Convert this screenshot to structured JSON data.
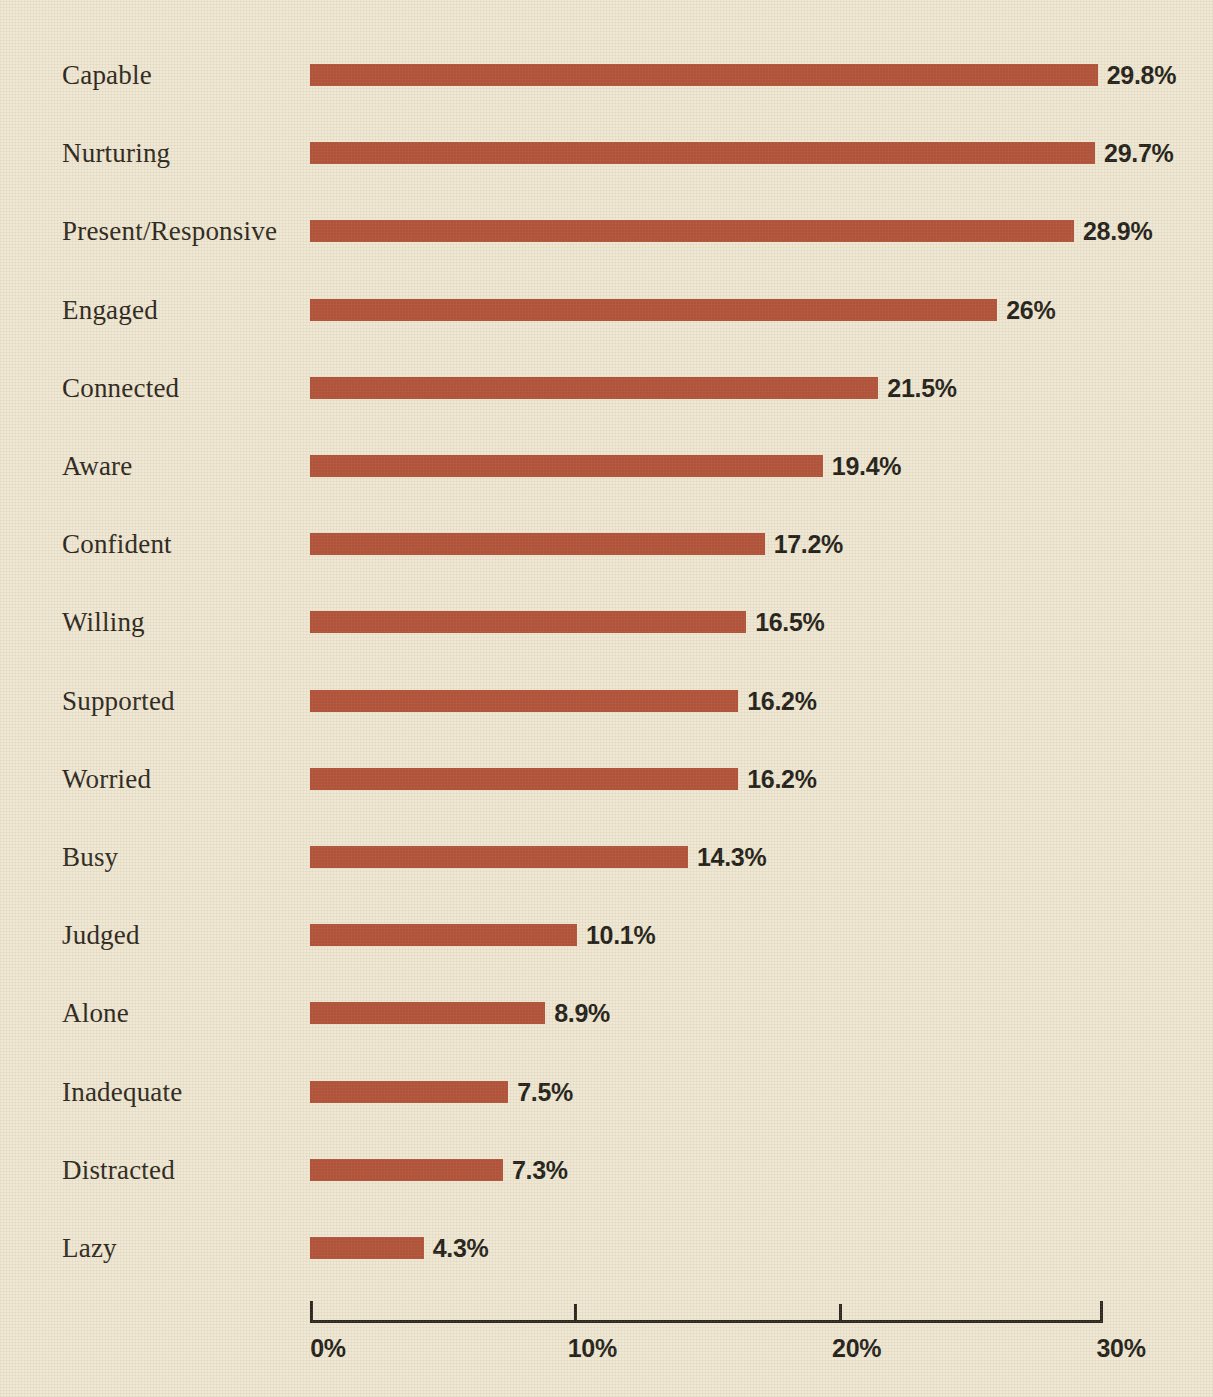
{
  "chart_data": {
    "type": "bar",
    "orientation": "horizontal",
    "title": "",
    "subtitle": "",
    "xlabel": "",
    "ylabel": "",
    "xlim": [
      0,
      30
    ],
    "grid": false,
    "legend": null,
    "categories": [
      "Capable",
      "Nurturing",
      "Present/Responsive",
      "Engaged",
      "Connected",
      "Aware",
      "Confident",
      "Willing",
      "Supported",
      "Worried",
      "Busy",
      "Judged",
      "Alone",
      "Inadequate",
      "Distracted",
      "Lazy"
    ],
    "values": [
      29.8,
      29.7,
      28.9,
      26,
      21.5,
      19.4,
      17.2,
      16.5,
      16.2,
      16.2,
      14.3,
      10.1,
      8.9,
      7.5,
      7.3,
      4.3
    ],
    "value_labels": [
      "29.8%",
      "29.7%",
      "28.9%",
      "26%",
      "21.5%",
      "19.4%",
      "17.2%",
      "16.5%",
      "16.2%",
      "16.2%",
      "14.3%",
      "10.1%",
      "8.9%",
      "7.5%",
      "7.3%",
      "4.3%"
    ],
    "xticks": [
      0,
      10,
      20,
      30
    ],
    "xtick_labels": [
      "0%",
      "10%",
      "20%",
      "30%"
    ]
  },
  "colors": {
    "background": "#efe8d4",
    "bar": "#b2523a",
    "text": "#2b2620",
    "value_text": "#231f1b",
    "axis": "#2b2620"
  }
}
